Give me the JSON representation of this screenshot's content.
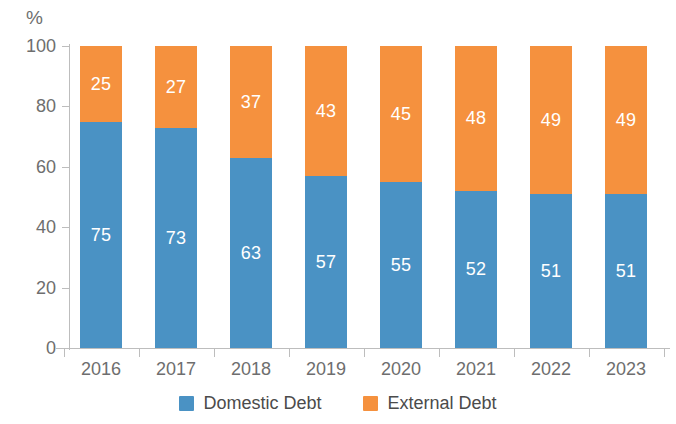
{
  "chart_data": {
    "type": "bar",
    "stacked": true,
    "title": "",
    "subtitle": "",
    "xlabel": "",
    "ylabel": "%",
    "ylim": [
      0,
      100
    ],
    "yticks": [
      0,
      20,
      40,
      60,
      80,
      100
    ],
    "grid": false,
    "legend_position": "bottom-center",
    "categories": [
      "2016",
      "2017",
      "2018",
      "2019",
      "2020",
      "2021",
      "2022",
      "2023"
    ],
    "series": [
      {
        "name": "Domestic Debt",
        "color": "#4A92C4",
        "values": [
          75,
          73,
          63,
          57,
          55,
          52,
          51,
          51
        ]
      },
      {
        "name": "External Debt",
        "color": "#F5913E",
        "values": [
          25,
          27,
          37,
          43,
          45,
          48,
          49,
          49
        ]
      }
    ]
  },
  "axis": {
    "unit_label": "%",
    "tick_color": "#BDBDBD",
    "label_color": "#6E6E6E"
  },
  "legend": {
    "items": [
      {
        "label": "Domestic Debt",
        "color": "#4A92C4"
      },
      {
        "label": "External Debt",
        "color": "#F5913E"
      }
    ]
  }
}
